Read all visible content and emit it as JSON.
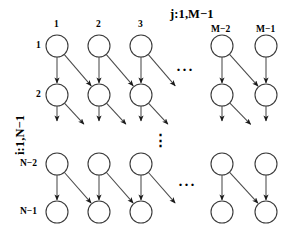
{
  "figure": {
    "type": "lattice-dependency-graph",
    "background_color": "#ffffff",
    "line_color": "#4a4a4a",
    "node_stroke_color": "#3a3a3a",
    "node_fill_color": "#ffffff",
    "arrow_color": "#1a1a1a"
  },
  "axes": {
    "top_label": "j:1,M−1",
    "left_label": "i:1,N−1"
  },
  "column_labels": [
    "1",
    "2",
    "3",
    "M−2",
    "M−1"
  ],
  "row_labels": [
    "1",
    "2",
    "N−2",
    "N−1"
  ],
  "ellipses": {
    "top_row_horizontal": "···",
    "middle_vertical": "⋮",
    "bottom_row_horizontal": "···"
  },
  "geometry": {
    "node_radius": 11,
    "columns_x": [
      57,
      99,
      141,
      222,
      266
    ],
    "rows_y": [
      46,
      95,
      164,
      212
    ]
  },
  "nodes": [
    {
      "id": "r0c0",
      "row": 0,
      "col": 0,
      "cx": 57,
      "cy": 46
    },
    {
      "id": "r0c1",
      "row": 0,
      "col": 1,
      "cx": 99,
      "cy": 46
    },
    {
      "id": "r0c2",
      "row": 0,
      "col": 2,
      "cx": 141,
      "cy": 46
    },
    {
      "id": "r0c3",
      "row": 0,
      "col": 3,
      "cx": 222,
      "cy": 46
    },
    {
      "id": "r0c4",
      "row": 0,
      "col": 4,
      "cx": 266,
      "cy": 46
    },
    {
      "id": "r1c0",
      "row": 1,
      "col": 0,
      "cx": 57,
      "cy": 95
    },
    {
      "id": "r1c1",
      "row": 1,
      "col": 1,
      "cx": 99,
      "cy": 95
    },
    {
      "id": "r1c2",
      "row": 1,
      "col": 2,
      "cx": 141,
      "cy": 95
    },
    {
      "id": "r1c3",
      "row": 1,
      "col": 3,
      "cx": 222,
      "cy": 95
    },
    {
      "id": "r1c4",
      "row": 1,
      "col": 4,
      "cx": 266,
      "cy": 95
    },
    {
      "id": "r2c0",
      "row": 2,
      "col": 0,
      "cx": 57,
      "cy": 164
    },
    {
      "id": "r2c1",
      "row": 2,
      "col": 1,
      "cx": 99,
      "cy": 164
    },
    {
      "id": "r2c2",
      "row": 2,
      "col": 2,
      "cx": 141,
      "cy": 164
    },
    {
      "id": "r2c3",
      "row": 2,
      "col": 3,
      "cx": 222,
      "cy": 164
    },
    {
      "id": "r2c4",
      "row": 2,
      "col": 4,
      "cx": 266,
      "cy": 164
    },
    {
      "id": "r3c0",
      "row": 3,
      "col": 0,
      "cx": 57,
      "cy": 212
    },
    {
      "id": "r3c1",
      "row": 3,
      "col": 1,
      "cx": 99,
      "cy": 212
    },
    {
      "id": "r3c2",
      "row": 3,
      "col": 2,
      "cx": 141,
      "cy": 212
    },
    {
      "id": "r3c3",
      "row": 3,
      "col": 3,
      "cx": 222,
      "cy": 212
    },
    {
      "id": "r3c4",
      "row": 3,
      "col": 4,
      "cx": 266,
      "cy": 212
    }
  ],
  "edges": [
    {
      "kind": "vertical",
      "from": [
        57,
        46
      ],
      "to": [
        57,
        95
      ]
    },
    {
      "kind": "vertical",
      "from": [
        99,
        46
      ],
      "to": [
        99,
        95
      ]
    },
    {
      "kind": "vertical",
      "from": [
        141,
        46
      ],
      "to": [
        141,
        95
      ]
    },
    {
      "kind": "vertical",
      "from": [
        222,
        46
      ],
      "to": [
        222,
        95
      ]
    },
    {
      "kind": "vertical",
      "from": [
        266,
        46
      ],
      "to": [
        266,
        95
      ]
    },
    {
      "kind": "diagonal",
      "from": [
        57,
        46
      ],
      "to": [
        99,
        95
      ]
    },
    {
      "kind": "diagonal",
      "from": [
        99,
        46
      ],
      "to": [
        141,
        95
      ]
    },
    {
      "kind": "diagonal",
      "from": [
        141,
        46
      ],
      "to": [
        183,
        95
      ]
    },
    {
      "kind": "diagonal",
      "from": [
        222,
        46
      ],
      "to": [
        266,
        95
      ]
    },
    {
      "kind": "vertical",
      "from": [
        57,
        95
      ],
      "to": [
        57,
        133
      ]
    },
    {
      "kind": "vertical",
      "from": [
        99,
        95
      ],
      "to": [
        99,
        133
      ]
    },
    {
      "kind": "vertical",
      "from": [
        141,
        95
      ],
      "to": [
        141,
        133
      ]
    },
    {
      "kind": "vertical",
      "from": [
        222,
        95
      ],
      "to": [
        222,
        133
      ]
    },
    {
      "kind": "vertical",
      "from": [
        266,
        95
      ],
      "to": [
        266,
        133
      ]
    },
    {
      "kind": "diagonal",
      "from": [
        57,
        95
      ],
      "to": [
        92,
        133
      ]
    },
    {
      "kind": "diagonal",
      "from": [
        99,
        95
      ],
      "to": [
        134,
        133
      ]
    },
    {
      "kind": "diagonal",
      "from": [
        141,
        95
      ],
      "to": [
        176,
        133
      ]
    },
    {
      "kind": "diagonal",
      "from": [
        222,
        95
      ],
      "to": [
        259,
        133
      ]
    },
    {
      "kind": "vertical",
      "from": [
        57,
        164
      ],
      "to": [
        57,
        212
      ]
    },
    {
      "kind": "vertical",
      "from": [
        99,
        164
      ],
      "to": [
        99,
        212
      ]
    },
    {
      "kind": "vertical",
      "from": [
        141,
        164
      ],
      "to": [
        141,
        212
      ]
    },
    {
      "kind": "vertical",
      "from": [
        222,
        164
      ],
      "to": [
        222,
        212
      ]
    },
    {
      "kind": "vertical",
      "from": [
        266,
        164
      ],
      "to": [
        266,
        212
      ]
    },
    {
      "kind": "diagonal",
      "from": [
        57,
        164
      ],
      "to": [
        99,
        212
      ]
    },
    {
      "kind": "diagonal",
      "from": [
        99,
        164
      ],
      "to": [
        141,
        212
      ]
    },
    {
      "kind": "diagonal",
      "from": [
        141,
        164
      ],
      "to": [
        183,
        212
      ]
    },
    {
      "kind": "diagonal",
      "from": [
        222,
        164
      ],
      "to": [
        266,
        212
      ]
    }
  ],
  "label_positions": {
    "top_axis": {
      "x": 170,
      "y": 8
    },
    "left_axis": {
      "x": 14,
      "y": 155
    },
    "col_1": {
      "x": 54,
      "y": 20
    },
    "col_2": {
      "x": 96,
      "y": 20
    },
    "col_3": {
      "x": 138,
      "y": 20
    },
    "col_M2": {
      "x": 211,
      "y": 25
    },
    "col_M1": {
      "x": 256,
      "y": 25
    },
    "row_1": {
      "x": 36,
      "y": 41
    },
    "row_2": {
      "x": 36,
      "y": 90
    },
    "row_N2": {
      "x": 20,
      "y": 159
    },
    "row_N1": {
      "x": 20,
      "y": 207
    },
    "ell_top": {
      "x": 176,
      "y": 63
    },
    "ell_mid": {
      "x": 153,
      "y": 133
    },
    "ell_bot": {
      "x": 178,
      "y": 178
    }
  }
}
